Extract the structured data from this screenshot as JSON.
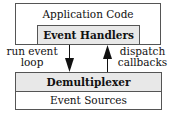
{
  "diagram": {
    "top_box": {
      "label": "Application Code",
      "inner": {
        "label": "Event Handlers"
      }
    },
    "bottom_box": {
      "header": {
        "label": "Demultiplexer"
      },
      "body": {
        "label": "Event Sources"
      }
    },
    "arrows": [
      {
        "label_line1": "run event",
        "label_line2": "loop",
        "direction": "down",
        "from": "Event Handlers",
        "to": "Demultiplexer"
      },
      {
        "label_line1": "dispatch",
        "label_line2": "callbacks",
        "direction": "up",
        "from": "Demultiplexer",
        "to": "Event Handlers"
      }
    ],
    "colors": {
      "fill_gray": "#e8e8e8",
      "border": "#555555",
      "text": "#111111"
    }
  }
}
